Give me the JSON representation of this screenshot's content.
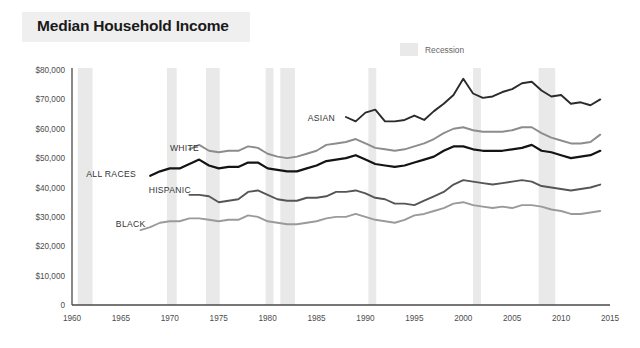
{
  "header": {
    "title": "Median Household Income"
  },
  "legend": {
    "position": "top-right",
    "items": [
      {
        "label": "Recession",
        "swatch_color": "#e3e3e3",
        "name": "recession-swatch"
      }
    ]
  },
  "chart_data": {
    "type": "line",
    "title": "Median Household Income",
    "subtitle": "",
    "xlabel": "",
    "ylabel": "",
    "xlim": [
      1960,
      2015
    ],
    "ylim": [
      0,
      80000
    ],
    "grid": false,
    "legend_position": "top-right",
    "y_ticks": [
      "0",
      "$10,000",
      "$20,000",
      "$30,000",
      "$40,000",
      "$50,000",
      "$60,000",
      "$70,000",
      "$80,000"
    ],
    "y_tick_values": [
      0,
      10000,
      20000,
      30000,
      40000,
      50000,
      60000,
      70000,
      80000
    ],
    "x_ticks": [
      "1960",
      "1965",
      "1970",
      "1975",
      "1980",
      "1985",
      "1990",
      "1995",
      "2000",
      "2005",
      "2010",
      "2015"
    ],
    "x_tick_values": [
      1960,
      1965,
      1970,
      1975,
      1980,
      1985,
      1990,
      1995,
      2000,
      2005,
      2010,
      2015
    ],
    "annotations": [
      {
        "text": "WHITE",
        "x": 1971.5,
        "y": 53500
      },
      {
        "text": "ALL RACES",
        "x": 1964.0,
        "y": 44500
      },
      {
        "text": "HISPANIC",
        "x": 1970.0,
        "y": 39000
      },
      {
        "text": "BLACK",
        "x": 1966.0,
        "y": 27500
      },
      {
        "text": "ASIAN",
        "x": 1985.5,
        "y": 63500
      }
    ],
    "recession_bands": [
      {
        "start": 1960.6,
        "end": 1962.1
      },
      {
        "start": 1969.7,
        "end": 1970.7
      },
      {
        "start": 1973.7,
        "end": 1975.1
      },
      {
        "start": 1979.8,
        "end": 1980.6
      },
      {
        "start": 1981.3,
        "end": 1982.8
      },
      {
        "start": 1990.3,
        "end": 1991.1
      },
      {
        "start": 2001.0,
        "end": 2001.8
      },
      {
        "start": 2007.7,
        "end": 2009.4
      }
    ],
    "series": [
      {
        "name": "ASIAN",
        "color": "#2b2b2b",
        "width": 1.9,
        "x": [
          1988,
          1989,
          1990,
          1991,
          1992,
          1993,
          1994,
          1995,
          1996,
          1997,
          1998,
          1999,
          2000,
          2001,
          2002,
          2003,
          2004,
          2005,
          2006,
          2007,
          2008,
          2009,
          2010,
          2011,
          2012,
          2013,
          2014
        ],
        "values": [
          64000,
          62500,
          65500,
          66500,
          62500,
          62500,
          63000,
          64500,
          63000,
          66000,
          68500,
          71500,
          77000,
          72000,
          70500,
          71000,
          72500,
          73500,
          75500,
          76000,
          73000,
          71000,
          71500,
          68500,
          69000,
          68000,
          70000
        ]
      },
      {
        "name": "WHITE",
        "color": "#8c8c8c",
        "width": 1.9,
        "x": [
          1972,
          1973,
          1974,
          1975,
          1976,
          1977,
          1978,
          1979,
          1980,
          1981,
          1982,
          1983,
          1984,
          1985,
          1986,
          1987,
          1988,
          1989,
          1990,
          1991,
          1992,
          1993,
          1994,
          1995,
          1996,
          1997,
          1998,
          1999,
          2000,
          2001,
          2002,
          2003,
          2004,
          2005,
          2006,
          2007,
          2008,
          2009,
          2010,
          2011,
          2012,
          2013,
          2014
        ],
        "values": [
          53000,
          54500,
          52500,
          52000,
          52500,
          52500,
          54000,
          53500,
          51500,
          50500,
          50000,
          50500,
          51500,
          52500,
          54500,
          55000,
          55500,
          56500,
          55000,
          53500,
          53000,
          52500,
          53000,
          54000,
          55000,
          56500,
          58500,
          60000,
          60500,
          59500,
          59000,
          59000,
          59000,
          59500,
          60500,
          60500,
          58500,
          57000,
          56000,
          55000,
          55000,
          55500,
          58000
        ]
      },
      {
        "name": "ALL RACES",
        "color": "#141414",
        "width": 2.2,
        "x": [
          1968,
          1969,
          1970,
          1971,
          1972,
          1973,
          1974,
          1975,
          1976,
          1977,
          1978,
          1979,
          1980,
          1981,
          1982,
          1983,
          1984,
          1985,
          1986,
          1987,
          1988,
          1989,
          1990,
          1991,
          1992,
          1993,
          1994,
          1995,
          1996,
          1997,
          1998,
          1999,
          2000,
          2001,
          2002,
          2003,
          2004,
          2005,
          2006,
          2007,
          2008,
          2009,
          2010,
          2011,
          2012,
          2013,
          2014
        ],
        "values": [
          44000,
          45500,
          46500,
          46500,
          48000,
          49500,
          47500,
          46500,
          47000,
          47000,
          48500,
          48500,
          46500,
          46000,
          45500,
          45500,
          46500,
          47500,
          49000,
          49500,
          50000,
          51000,
          49500,
          48000,
          47500,
          47000,
          47500,
          48500,
          49500,
          50500,
          52500,
          54000,
          54000,
          53000,
          52500,
          52500,
          52500,
          53000,
          53500,
          54500,
          52500,
          52000,
          51000,
          50000,
          50500,
          51000,
          52500
        ]
      },
      {
        "name": "HISPANIC",
        "color": "#555555",
        "width": 1.9,
        "x": [
          1972,
          1973,
          1974,
          1975,
          1976,
          1977,
          1978,
          1979,
          1980,
          1981,
          1982,
          1983,
          1984,
          1985,
          1986,
          1987,
          1988,
          1989,
          1990,
          1991,
          1992,
          1993,
          1994,
          1995,
          1996,
          1997,
          1998,
          1999,
          2000,
          2001,
          2002,
          2003,
          2004,
          2005,
          2006,
          2007,
          2008,
          2009,
          2010,
          2011,
          2012,
          2013,
          2014
        ],
        "values": [
          37500,
          37500,
          37000,
          35000,
          35500,
          36000,
          38500,
          39000,
          37500,
          36000,
          35500,
          35500,
          36500,
          36500,
          37000,
          38500,
          38500,
          39000,
          38000,
          36500,
          36000,
          34500,
          34500,
          34000,
          35500,
          37000,
          38500,
          41000,
          42500,
          42000,
          41500,
          41000,
          41500,
          42000,
          42500,
          42000,
          40500,
          40000,
          39500,
          39000,
          39500,
          40000,
          41000
        ]
      },
      {
        "name": "BLACK",
        "color": "#9a9a9a",
        "width": 1.9,
        "x": [
          1967,
          1968,
          1969,
          1970,
          1971,
          1972,
          1973,
          1974,
          1975,
          1976,
          1977,
          1978,
          1979,
          1980,
          1981,
          1982,
          1983,
          1984,
          1985,
          1986,
          1987,
          1988,
          1989,
          1990,
          1991,
          1992,
          1993,
          1994,
          1995,
          1996,
          1997,
          1998,
          1999,
          2000,
          2001,
          2002,
          2003,
          2004,
          2005,
          2006,
          2007,
          2008,
          2009,
          2010,
          2011,
          2012,
          2013,
          2014
        ],
        "values": [
          25500,
          26500,
          28000,
          28500,
          28500,
          29500,
          29500,
          29000,
          28500,
          29000,
          29000,
          30500,
          30000,
          28500,
          28000,
          27500,
          27500,
          28000,
          28500,
          29500,
          30000,
          30000,
          31000,
          30000,
          29000,
          28500,
          28000,
          29000,
          30500,
          31000,
          32000,
          33000,
          34500,
          35000,
          34000,
          33500,
          33000,
          33500,
          33000,
          34000,
          34000,
          33500,
          32500,
          32000,
          31000,
          31000,
          31500,
          32000
        ]
      }
    ]
  }
}
